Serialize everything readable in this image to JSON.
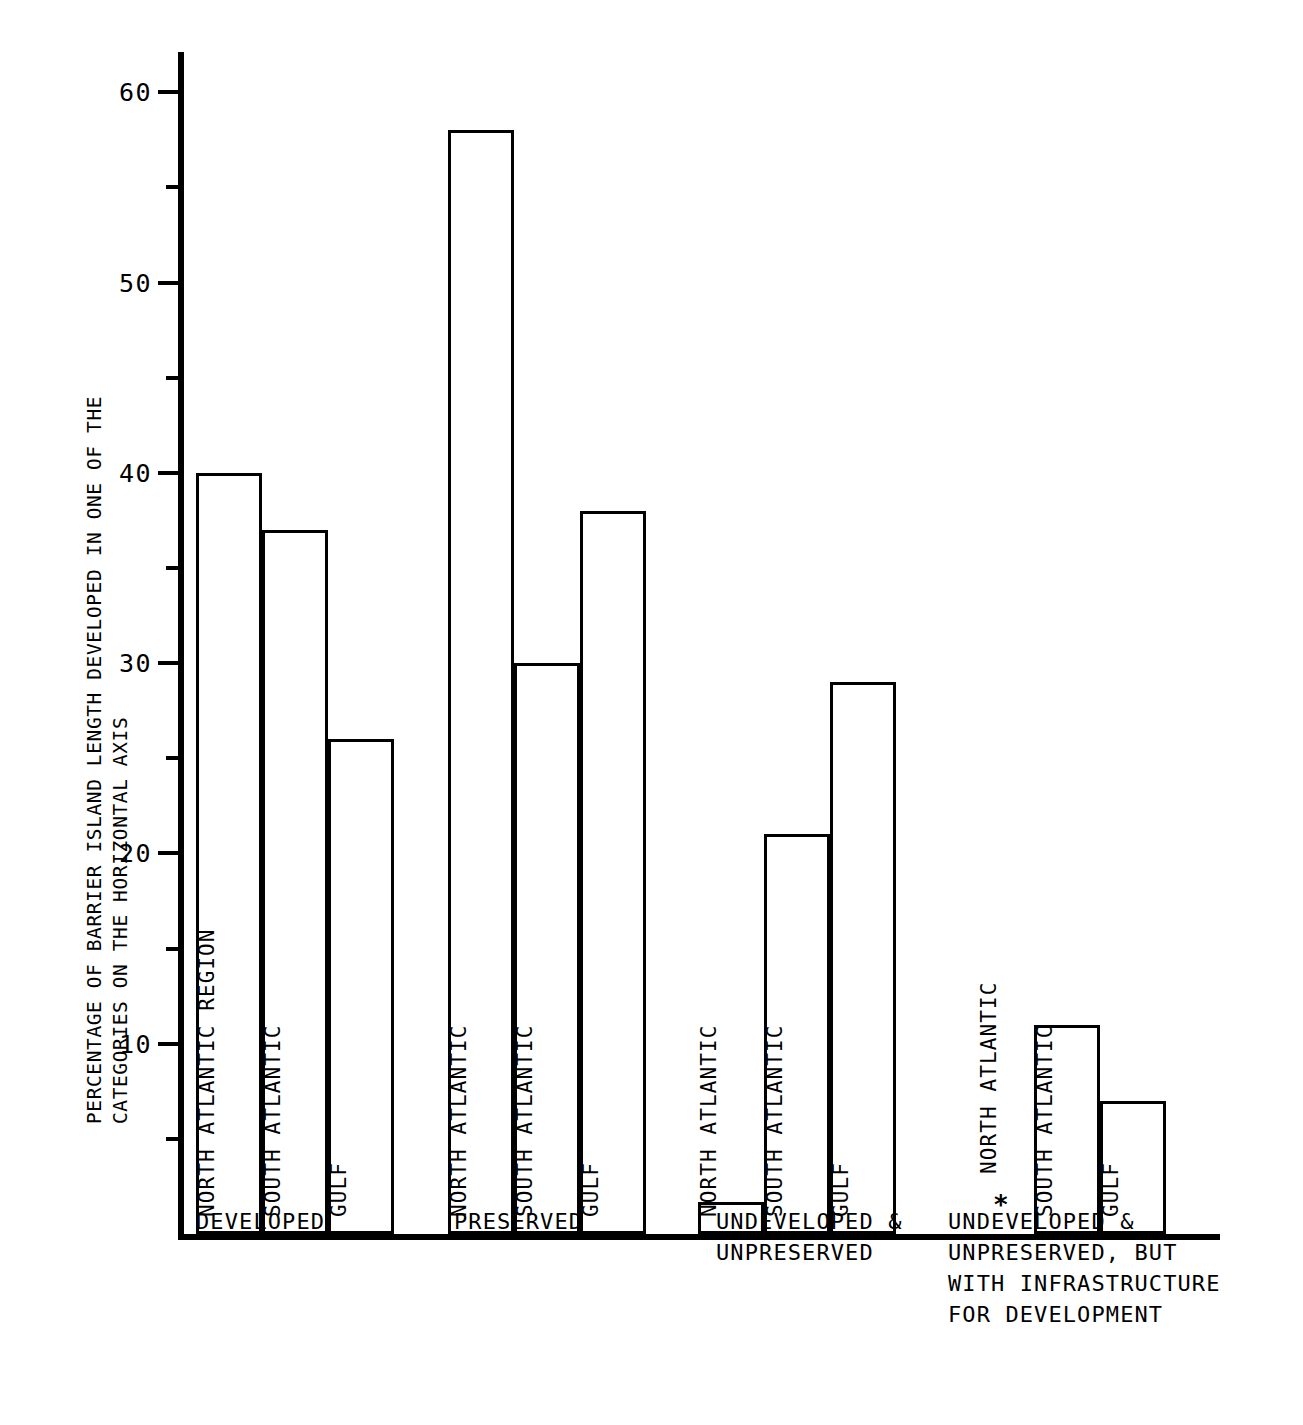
{
  "axis": {
    "y_title_line1": "PERCENTAGE OF BARRIER ISLAND LENGTH DEVELOPED IN ONE OF THE",
    "y_title_line2": "CATEGORIES ON THE HORIZONTAL AXIS",
    "y_ticks_major": [
      "10",
      "20",
      "30",
      "40",
      "50",
      "60"
    ],
    "y_ticks_minor": [
      5,
      15,
      25,
      35,
      45,
      55
    ],
    "y_min": 0,
    "y_max": 62
  },
  "groups": [
    {
      "label": "DEVELOPED",
      "bars": [
        {
          "label": "NORTH ATLANTIC REGION",
          "value": 40
        },
        {
          "label": "SOUTH ATLANTIC",
          "value": 37
        },
        {
          "label": "GULF",
          "value": 26
        }
      ]
    },
    {
      "label": "PRESERVED",
      "bars": [
        {
          "label": "NORTH ATLANTIC",
          "value": 58
        },
        {
          "label": "SOUTH ATLANTIC",
          "value": 30
        },
        {
          "label": "GULF",
          "value": 38
        }
      ]
    },
    {
      "label": "UNDEVELOPED &\nUNPRESERVED",
      "bars": [
        {
          "label": "NORTH ATLANTIC",
          "value": 1.7
        },
        {
          "label": "SOUTH ATLANTIC",
          "value": 21
        },
        {
          "label": "GULF",
          "value": 29
        }
      ]
    },
    {
      "label": "UNDEVELOPED &\nUNPRESERVED, BUT\nWITH INFRASTRUCTURE\nFOR DEVELOPMENT",
      "bars": [
        {
          "label": "NORTH ATLANTIC",
          "value": 0,
          "marker": "*"
        },
        {
          "label": "SOUTH ATLANTIC",
          "value": 11
        },
        {
          "label": "GULF",
          "value": 7
        }
      ]
    }
  ],
  "chart_data": {
    "type": "bar",
    "title": "",
    "xlabel": "",
    "ylabel": "PERCENTAGE OF BARRIER ISLAND LENGTH DEVELOPED IN ONE OF THE CATEGORIES ON THE HORIZONTAL AXIS",
    "ylim": [
      0,
      62
    ],
    "ytick_values": [
      10,
      20,
      30,
      40,
      50,
      60
    ],
    "ytick_labels": [
      "10",
      "20",
      "30",
      "40",
      "50",
      "60"
    ],
    "minor_ytick_values": [
      5,
      15,
      25,
      35,
      45,
      55
    ],
    "grid": false,
    "legend": false,
    "categories": [
      "DEVELOPED",
      "PRESERVED",
      "UNDEVELOPED & UNPRESERVED",
      "UNDEVELOPED & UNPRESERVED, BUT WITH INFRASTRUCTURE FOR DEVELOPMENT"
    ],
    "series": [
      {
        "name": "NORTH ATLANTIC REGION",
        "values": [
          40,
          58,
          1.7,
          0
        ]
      },
      {
        "name": "SOUTH ATLANTIC",
        "values": [
          37,
          30,
          21,
          11
        ]
      },
      {
        "name": "GULF",
        "values": [
          26,
          38,
          29,
          7
        ]
      }
    ],
    "annotations": [
      {
        "text": "*",
        "category": "UNDEVELOPED & UNPRESERVED, BUT WITH INFRASTRUCTURE FOR DEVELOPMENT",
        "series": "NORTH ATLANTIC",
        "note": "no bar shown / zero value"
      }
    ]
  }
}
